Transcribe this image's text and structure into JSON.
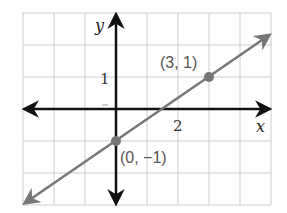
{
  "chart_data": {
    "type": "line",
    "title": "",
    "xlabel": "x",
    "ylabel": "y",
    "xlim": [
      -3,
      5
    ],
    "ylim": [
      -3,
      3
    ],
    "grid": true,
    "grid_step": 1,
    "tick_labels": {
      "x": [
        {
          "value": 2,
          "label": "2"
        }
      ],
      "y": [
        {
          "value": 1,
          "label": "1"
        }
      ]
    },
    "series": [
      {
        "name": "line",
        "equation": "y = (2/3)x - 1",
        "slope": 0.6667,
        "intercept": -1,
        "x": [
          -3,
          5
        ],
        "y": [
          -3,
          2.3333
        ],
        "arrows_both_ends": true,
        "color": "#777777"
      }
    ],
    "points": [
      {
        "x": 3,
        "y": 1,
        "label": "(3, 1)"
      },
      {
        "x": 0,
        "y": -1,
        "label": "(0, −1)"
      }
    ],
    "colors": {
      "axes": "#111111",
      "line": "#777777",
      "grid": "#cccccc",
      "points": "#777777"
    }
  },
  "labels": {
    "x_axis": "x",
    "y_axis": "y",
    "x_tick": "2",
    "y_tick": "1",
    "point_a": "(3, 1)",
    "point_b": "(0, −1)"
  }
}
